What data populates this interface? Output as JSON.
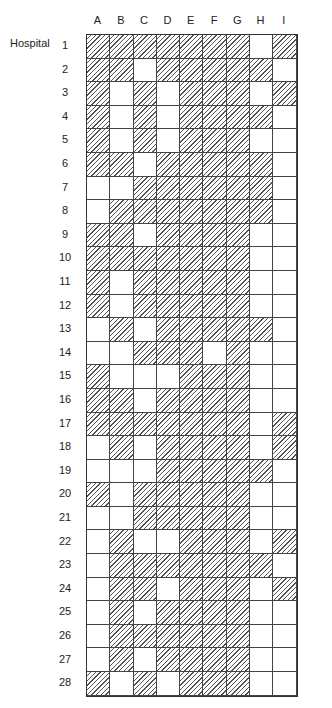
{
  "row_axis_label": "Hospital",
  "columns": [
    "A",
    "B",
    "C",
    "D",
    "E",
    "F",
    "G",
    "H",
    "I"
  ],
  "rows": [
    {
      "label": "1",
      "cells": [
        1,
        1,
        1,
        1,
        1,
        1,
        1,
        0,
        1
      ]
    },
    {
      "label": "2",
      "cells": [
        1,
        1,
        0,
        1,
        1,
        1,
        1,
        1,
        0
      ]
    },
    {
      "label": "3",
      "cells": [
        1,
        0,
        1,
        0,
        1,
        1,
        1,
        0,
        1
      ]
    },
    {
      "label": "4",
      "cells": [
        1,
        0,
        1,
        0,
        1,
        1,
        1,
        1,
        0
      ]
    },
    {
      "label": "5",
      "cells": [
        1,
        0,
        1,
        0,
        1,
        1,
        1,
        0,
        0
      ]
    },
    {
      "label": "6",
      "cells": [
        1,
        1,
        0,
        1,
        1,
        1,
        1,
        1,
        0
      ]
    },
    {
      "label": "7",
      "cells": [
        0,
        0,
        1,
        1,
        1,
        1,
        1,
        1,
        0
      ]
    },
    {
      "label": "8",
      "cells": [
        0,
        1,
        1,
        1,
        1,
        1,
        1,
        1,
        0
      ]
    },
    {
      "label": "9",
      "cells": [
        1,
        1,
        0,
        1,
        1,
        1,
        1,
        0,
        0
      ]
    },
    {
      "label": "10",
      "cells": [
        1,
        1,
        1,
        1,
        1,
        1,
        1,
        0,
        0
      ]
    },
    {
      "label": "11",
      "cells": [
        1,
        0,
        1,
        1,
        1,
        1,
        1,
        0,
        0
      ]
    },
    {
      "label": "12",
      "cells": [
        1,
        0,
        1,
        1,
        1,
        1,
        1,
        0,
        0
      ]
    },
    {
      "label": "13",
      "cells": [
        0,
        1,
        0,
        1,
        1,
        1,
        1,
        1,
        0
      ]
    },
    {
      "label": "14",
      "cells": [
        0,
        0,
        1,
        1,
        1,
        0,
        1,
        0,
        0
      ]
    },
    {
      "label": "15",
      "cells": [
        1,
        0,
        0,
        0,
        1,
        1,
        1,
        0,
        0
      ]
    },
    {
      "label": "16",
      "cells": [
        1,
        1,
        0,
        1,
        1,
        1,
        1,
        0,
        0
      ]
    },
    {
      "label": "17",
      "cells": [
        1,
        1,
        1,
        1,
        1,
        1,
        1,
        0,
        1
      ]
    },
    {
      "label": "18",
      "cells": [
        0,
        1,
        0,
        1,
        1,
        1,
        1,
        0,
        1
      ]
    },
    {
      "label": "19",
      "cells": [
        0,
        0,
        0,
        1,
        1,
        1,
        1,
        1,
        0
      ]
    },
    {
      "label": "20",
      "cells": [
        1,
        0,
        1,
        1,
        1,
        1,
        1,
        0,
        0
      ]
    },
    {
      "label": "21",
      "cells": [
        0,
        0,
        1,
        1,
        1,
        1,
        1,
        0,
        0
      ]
    },
    {
      "label": "22",
      "cells": [
        0,
        1,
        0,
        0,
        1,
        1,
        1,
        0,
        1
      ]
    },
    {
      "label": "23",
      "cells": [
        0,
        1,
        1,
        1,
        1,
        1,
        1,
        1,
        0
      ]
    },
    {
      "label": "24",
      "cells": [
        0,
        1,
        1,
        0,
        1,
        1,
        1,
        0,
        1
      ]
    },
    {
      "label": "25",
      "cells": [
        0,
        1,
        0,
        1,
        1,
        1,
        1,
        0,
        0
      ]
    },
    {
      "label": "26",
      "cells": [
        0,
        1,
        1,
        1,
        1,
        1,
        1,
        0,
        0
      ]
    },
    {
      "label": "27",
      "cells": [
        0,
        1,
        0,
        1,
        1,
        1,
        1,
        0,
        0
      ]
    },
    {
      "label": "28",
      "cells": [
        1,
        0,
        1,
        0,
        1,
        1,
        1,
        0,
        0
      ]
    }
  ],
  "legend": {
    "hatched": "present",
    "blank": "absent"
  }
}
